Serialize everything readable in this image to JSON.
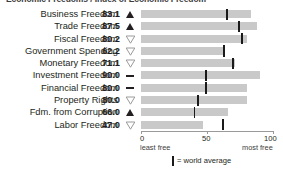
{
  "title_partial": "Economic Freedoms / Index of Economic Freedom",
  "legend": {
    "marker_name": "world-average-marker",
    "text": "= world average"
  },
  "axis": {
    "ticks": [
      "0",
      "50",
      "100"
    ],
    "left_label": "least free",
    "right_label": "most free",
    "min": 0,
    "max": 100
  },
  "colors": {
    "bar": "#c9c9c9",
    "marker": "#1a1a1a",
    "text": "#231f20",
    "axis": "#9a9a9a"
  },
  "chart_data": {
    "type": "bar",
    "title": "Economic Freedoms",
    "xlabel": "",
    "ylabel": "",
    "xlim": [
      0,
      100
    ],
    "grid": false,
    "orientation": "horizontal",
    "legend_position": "bottom",
    "categories": [
      "Business Freedom",
      "Trade Freedom",
      "Fiscal Freedom",
      "Government Spending",
      "Monetary Freedom",
      "Investment Freedom",
      "Financial Freedom",
      "Property Rights",
      "Fdm. from Corruption",
      "Labor Freedom"
    ],
    "values": [
      83.1,
      87.5,
      80.2,
      62.2,
      71.1,
      90.0,
      80.0,
      80.0,
      66.0,
      47.0
    ],
    "value_labels": [
      "83.1",
      "87.5",
      "80.2",
      "62.2",
      "71.1",
      "90.0",
      "80.0",
      "80.0",
      "66.0",
      "47.0"
    ],
    "trends": [
      "up",
      "up",
      "down",
      "down",
      "down",
      "flat",
      "flat",
      "down",
      "up",
      "down"
    ],
    "world_average": [
      65.0,
      74.5,
      76.5,
      63.0,
      70.0,
      49.0,
      49.0,
      43.5,
      40.5,
      62.0
    ],
    "series": [
      {
        "name": "score",
        "values": [
          83.1,
          87.5,
          80.2,
          62.2,
          71.1,
          90.0,
          80.0,
          80.0,
          66.0,
          47.0
        ]
      },
      {
        "name": "world average",
        "values": [
          65.0,
          74.5,
          76.5,
          63.0,
          70.0,
          49.0,
          49.0,
          43.5,
          40.5,
          62.0
        ]
      }
    ]
  }
}
